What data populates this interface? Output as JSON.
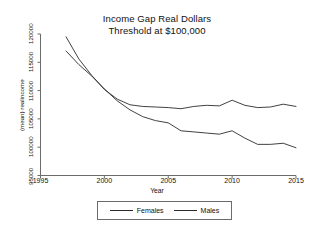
{
  "chart_data": {
    "type": "line",
    "title": "Income Gap Real Dollars",
    "subtitle": "Threshold at $100,000",
    "xlabel": "Year",
    "ylabel": "(mean) realincome",
    "xlim": [
      1995,
      2015
    ],
    "ylim": [
      95000,
      120000
    ],
    "xticks": [
      1995,
      2000,
      2005,
      2010,
      2015
    ],
    "yticks": [
      95000,
      100000,
      105000,
      110000,
      115000,
      120000
    ],
    "ytick_labels": [
      "95000",
      "100000",
      "105000",
      "110000",
      "115000",
      "120000"
    ],
    "xtick_labels": [
      "1995",
      "2000",
      "2005",
      "2010",
      "2015"
    ],
    "grid": false,
    "legend_position": "bottom",
    "x": [
      1997,
      1998,
      1999,
      2000,
      2001,
      2002,
      2003,
      2004,
      2005,
      2006,
      2007,
      2008,
      2009,
      2010,
      2011,
      2012,
      2013,
      2014,
      2015
    ],
    "series": [
      {
        "name": "Females",
        "color": "#2b2b2b",
        "values": [
          117000,
          114600,
          112600,
          110300,
          108200,
          106600,
          105400,
          104700,
          104300,
          102900,
          102700,
          102500,
          102300,
          102900,
          101600,
          100500,
          100500,
          100700,
          99900
        ]
      },
      {
        "name": "Males",
        "color": "#2b2b2b",
        "values": [
          119500,
          115600,
          112700,
          110200,
          108500,
          107500,
          107200,
          107100,
          107000,
          106800,
          107200,
          107400,
          107300,
          108300,
          107400,
          107000,
          107100,
          107600,
          107200
        ]
      }
    ]
  },
  "legend": {
    "items": [
      {
        "label": "Females"
      },
      {
        "label": "Males"
      }
    ]
  }
}
